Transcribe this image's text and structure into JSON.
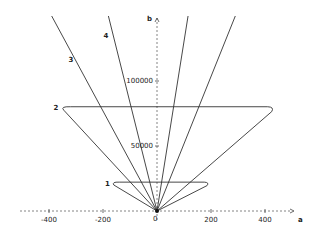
{
  "chart_data": {
    "type": "line",
    "title": "",
    "xlabel": "a",
    "ylabel": "b",
    "xlim": [
      -520,
      480
    ],
    "ylim": [
      -10000,
      145000
    ],
    "grid": false,
    "origin_label": "0",
    "x_ticks": [
      {
        "value": -400,
        "label": "-400"
      },
      {
        "value": -200,
        "label": "-200"
      },
      {
        "value": 200,
        "label": "200"
      },
      {
        "value": 400,
        "label": "400"
      }
    ],
    "y_ticks": [
      {
        "value": 50000,
        "label": "50000"
      },
      {
        "value": 100000,
        "label": "100000"
      }
    ],
    "series": [
      {
        "name": "1",
        "label": "1",
        "description": "small closed loop near origin",
        "points": [
          [
            0,
            0
          ],
          [
            -160,
            20000
          ],
          [
            -145,
            22000
          ],
          [
            180,
            22000
          ],
          [
            190,
            20000
          ],
          [
            0,
            0
          ]
        ]
      },
      {
        "name": "2",
        "label": "2",
        "description": "large closed loop",
        "points": [
          [
            0,
            0
          ],
          [
            -350,
            78000
          ],
          [
            -330,
            80000
          ],
          [
            420,
            80000
          ],
          [
            430,
            76000
          ],
          [
            0,
            0
          ]
        ]
      },
      {
        "name": "3",
        "label": "3",
        "description": "line through origin, steep negative slope",
        "points": [
          [
            0,
            0
          ],
          [
            -390,
            150000
          ]
        ]
      },
      {
        "name": "4",
        "label": "4",
        "description": "line through origin, steeper negative slope",
        "points": [
          [
            0,
            0
          ],
          [
            -180,
            150000
          ]
        ]
      },
      {
        "name": "5",
        "label": "",
        "description": "line through origin, positive slope",
        "points": [
          [
            0,
            0
          ],
          [
            115,
            150000
          ]
        ]
      },
      {
        "name": "6",
        "label": "",
        "description": "line through origin, gentler positive slope",
        "points": [
          [
            0,
            0
          ],
          [
            290,
            150000
          ]
        ]
      }
    ]
  }
}
